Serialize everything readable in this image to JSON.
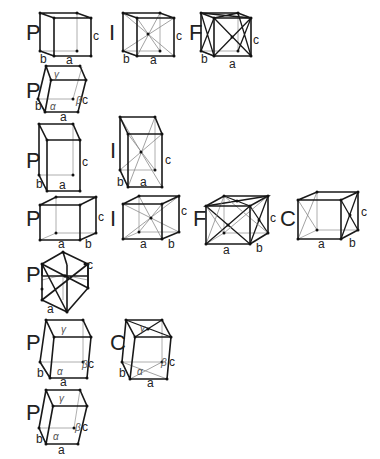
{
  "diagram": {
    "rows": [
      {
        "system_index": 1,
        "lattices": [
          {
            "type": "P",
            "axes": [
              "a",
              "b",
              "c"
            ]
          },
          {
            "type": "I",
            "axes": [
              "a",
              "b",
              "c"
            ]
          },
          {
            "type": "F",
            "axes": [
              "a",
              "b",
              "c"
            ]
          }
        ]
      },
      {
        "system_index": 2,
        "lattices": [
          {
            "type": "P",
            "axes": [
              "a",
              "b",
              "c"
            ],
            "angles": [
              "α",
              "β",
              "γ"
            ]
          }
        ]
      },
      {
        "system_index": 3,
        "lattices": [
          {
            "type": "P",
            "axes": [
              "a",
              "b",
              "c"
            ]
          },
          {
            "type": "I",
            "axes": [
              "a",
              "b",
              "c"
            ]
          }
        ]
      },
      {
        "system_index": 4,
        "lattices": [
          {
            "type": "P",
            "axes": [
              "a",
              "b",
              "c"
            ]
          },
          {
            "type": "I",
            "axes": [
              "a",
              "b",
              "c"
            ]
          },
          {
            "type": "F",
            "axes": [
              "a",
              "b",
              "c"
            ]
          },
          {
            "type": "C",
            "axes": [
              "a",
              "b",
              "c"
            ]
          }
        ]
      },
      {
        "system_index": 5,
        "lattices": [
          {
            "type": "P",
            "axes": [
              "a",
              "c"
            ]
          }
        ]
      },
      {
        "system_index": 6,
        "lattices": [
          {
            "type": "P",
            "axes": [
              "a",
              "b",
              "c"
            ],
            "angles": [
              "α",
              "β",
              "γ"
            ]
          },
          {
            "type": "C",
            "axes": [
              "a",
              "b",
              "c"
            ],
            "angles": [
              "α",
              "β",
              "γ"
            ]
          }
        ]
      },
      {
        "system_index": 7,
        "lattices": [
          {
            "type": "P",
            "axes": [
              "a",
              "b",
              "c"
            ],
            "angles": [
              "α",
              "β",
              "γ"
            ]
          }
        ]
      }
    ]
  },
  "labels": {
    "P": "P",
    "I": "I",
    "F": "F",
    "C": "C",
    "a": "a",
    "b": "b",
    "c": "c",
    "alpha": "α",
    "beta": "β",
    "gamma": "γ"
  }
}
